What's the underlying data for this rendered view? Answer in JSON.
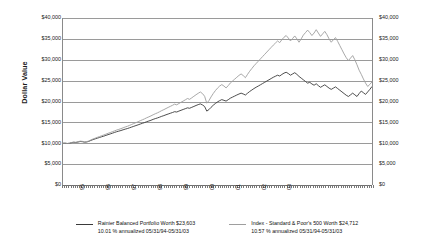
{
  "chart": {
    "ylabel": "Dollar Value",
    "y_ticks": [
      "$0",
      "$5,000",
      "$10,000",
      "$15,000",
      "$20,000",
      "$25,000",
      "$30,000",
      "$35,000",
      "$40,000"
    ],
    "x_ticks": [
      "95",
      "96",
      "97",
      "98",
      "99",
      "00",
      "01",
      "02",
      "03"
    ]
  },
  "legend": {
    "items": [
      {
        "name": "rainier-balanced-portfolio",
        "line1": "Rainier Balanced Portfolio Worth $23,603",
        "line2": "10.01 % annualized 05/31/94-05/31/03",
        "color": "#3a3a3a"
      },
      {
        "name": "sp500-index",
        "line1": "Index - Standard & Poor's 500 Worth $24,712",
        "line2": "10.57 % annualized 05/31/94-05/31/03",
        "color": "#9e9e9e"
      }
    ]
  },
  "chart_data": {
    "type": "line",
    "title": "",
    "xlabel": "",
    "ylabel": "Dollar Value",
    "ylim": [
      0,
      40000
    ],
    "ytick_step": 5000,
    "grid": true,
    "legend_position": "bottom",
    "x_start": "05/31/1994",
    "x_end": "05/31/2003",
    "x_tick_labels": [
      "95",
      "96",
      "97",
      "98",
      "99",
      "00",
      "01",
      "02",
      "03"
    ],
    "x_minor_ticks": "monthly",
    "initial_investment": 10000,
    "series": [
      {
        "name": "Rainier Balanced Portfolio",
        "color": "#3a3a3a",
        "final_value": 23603,
        "annualized_return_pct": 10.01,
        "values": [
          10000,
          10010,
          9940,
          9990,
          10150,
          10230,
          10180,
          10300,
          10420,
          10380,
          10260,
          10300,
          10450,
          10680,
          10880,
          11050,
          11220,
          11380,
          11550,
          11700,
          11890,
          12060,
          12230,
          12400,
          12590,
          12760,
          12900,
          13050,
          13220,
          13380,
          13520,
          13700,
          13880,
          14060,
          14240,
          14410,
          14600,
          14780,
          14950,
          15160,
          15330,
          15510,
          15720,
          15900,
          16060,
          16250,
          16450,
          16620,
          16820,
          17000,
          17180,
          17360,
          17560,
          17480,
          17700,
          17900,
          18090,
          18280,
          18480,
          18380,
          18600,
          18820,
          19050,
          19250,
          19430,
          19180,
          18800,
          17700,
          18050,
          18600,
          19100,
          19520,
          19900,
          20200,
          20450,
          20280,
          20100,
          20430,
          20800,
          21050,
          21300,
          21560,
          21790,
          22000,
          21800,
          21550,
          21980,
          22400,
          22750,
          23100,
          23420,
          23700,
          24000,
          24300,
          24600,
          24900,
          25200,
          25500,
          25800,
          26050,
          26300,
          26100,
          26480,
          26800,
          27000,
          26700,
          26300,
          26600,
          26900,
          26500,
          26000,
          25600,
          25200,
          24800,
          24400,
          24600,
          24200,
          23900,
          24250,
          23800,
          23400,
          23700,
          24000,
          23600,
          23200,
          22900,
          23200,
          23500,
          23100,
          22700,
          22300,
          21900,
          21500,
          21200,
          21600,
          22000,
          21600,
          21200,
          21900,
          22500,
          22100,
          21700,
          22300,
          22900,
          23603
        ]
      },
      {
        "name": "Index - Standard & Poor's 500",
        "color": "#9e9e9e",
        "final_value": 24712,
        "annualized_return_pct": 10.57,
        "values": [
          10000,
          10020,
          9950,
          10010,
          10180,
          10280,
          10220,
          10360,
          10500,
          10460,
          10320,
          10380,
          10540,
          10800,
          11020,
          11220,
          11420,
          11600,
          11800,
          11980,
          12180,
          12380,
          12560,
          12760,
          12960,
          13160,
          13320,
          13500,
          13700,
          13900,
          14060,
          14280,
          14500,
          14720,
          14940,
          15160,
          15400,
          15620,
          15840,
          16100,
          16320,
          16560,
          16820,
          17060,
          17280,
          17540,
          17820,
          18050,
          18320,
          18580,
          18830,
          19080,
          19360,
          19200,
          19520,
          19820,
          20100,
          20400,
          20720,
          20520,
          20880,
          21250,
          21620,
          21960,
          22280,
          21900,
          21250,
          19600,
          20200,
          21100,
          21900,
          22600,
          23200,
          23700,
          24050,
          23700,
          23250,
          23800,
          24450,
          24900,
          25350,
          25800,
          26250,
          26600,
          26200,
          25700,
          26500,
          27250,
          27900,
          28550,
          29100,
          29650,
          30200,
          30750,
          31300,
          31850,
          32400,
          32950,
          33500,
          34000,
          34500,
          34100,
          34800,
          35400,
          35800,
          35200,
          34500,
          35100,
          35700,
          35000,
          34200,
          35000,
          35900,
          36500,
          37100,
          36500,
          35800,
          36400,
          37200,
          36400,
          35600,
          36200,
          36800,
          36000,
          35000,
          34200,
          34800,
          35300,
          34400,
          33400,
          32400,
          31400,
          30500,
          29800,
          30400,
          31000,
          30000,
          28800,
          27500,
          26500,
          25400,
          24400,
          23600,
          24100,
          24712
        ]
      }
    ]
  }
}
